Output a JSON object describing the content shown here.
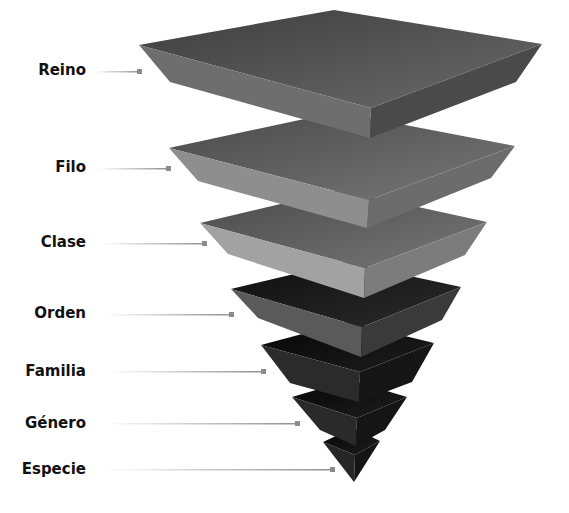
{
  "diagram": {
    "type": "inverted-pyramid",
    "levels": [
      {
        "label": "Reino",
        "label_y": 62,
        "line_y": 72,
        "line_end_x": 140
      },
      {
        "label": "Filo",
        "label_y": 159,
        "line_y": 169,
        "line_end_x": 169
      },
      {
        "label": "Clase",
        "label_y": 234,
        "line_y": 244,
        "line_end_x": 205
      },
      {
        "label": "Orden",
        "label_y": 305,
        "line_y": 315,
        "line_end_x": 232
      },
      {
        "label": "Familia",
        "label_y": 363,
        "line_y": 372,
        "line_end_x": 264
      },
      {
        "label": "Género",
        "label_y": 415,
        "line_y": 424,
        "line_end_x": 298
      },
      {
        "label": "Especie",
        "label_y": 461,
        "line_y": 470,
        "line_end_x": 333
      }
    ],
    "colors": {
      "connector_line": "#9a9a9a",
      "connector_marker": "#8c8c8c",
      "label_text": "#111111"
    }
  }
}
